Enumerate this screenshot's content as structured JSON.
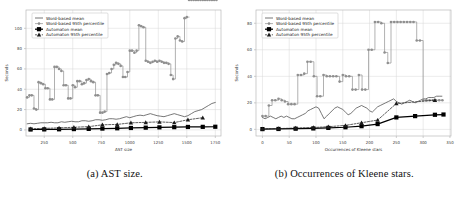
{
  "figure": {
    "subfigures": [
      {
        "caption": "(a) AST size.",
        "caption_label": "(a)",
        "caption_text": "AST size."
      },
      {
        "caption": "(b) Occurrences of Kleene stars.",
        "caption_label": "(b)",
        "caption_text": "Occurrences of Kleene stars."
      }
    ]
  },
  "legend_labels": {
    "word_mean": "Word-based mean",
    "word_p95": "Word-based 95th percentile",
    "auto_mean": "Automaton mean",
    "auto_p95": "Automaton 95th percentile"
  },
  "colors": {
    "word_mean": "#4a4a4a",
    "word_p95": "#8f8f8f",
    "auto_mean": "#000000",
    "auto_p95": "#1a1a1a",
    "grid": "#d6d6d6",
    "axis": "#b9b9b9",
    "background": "#ffffff"
  },
  "chart_data": [
    {
      "type": "line",
      "id": "ast-size",
      "title": "",
      "xlabel": "AST size",
      "ylabel": "Seconds",
      "xlim": [
        90,
        1800
      ],
      "ylim": [
        -6,
        118
      ],
      "xticks": [
        250,
        500,
        750,
        1000,
        1250,
        1500,
        1750
      ],
      "yticks": [
        0,
        20,
        40,
        60,
        80,
        100
      ],
      "grid": true,
      "legend_position": "upper left",
      "series": [
        {
          "name": "Word-based mean",
          "marker": "none",
          "x": [
            100,
            130,
            160,
            190,
            220,
            250,
            280,
            310,
            340,
            370,
            400,
            430,
            460,
            490,
            520,
            550,
            580,
            610,
            640,
            670,
            700,
            730,
            760,
            790,
            820,
            850,
            880,
            910,
            940,
            970,
            1000,
            1030,
            1060,
            1090,
            1120,
            1150,
            1180,
            1210,
            1240,
            1270,
            1300,
            1330,
            1360,
            1390,
            1420,
            1450,
            1480,
            1510,
            1540,
            1570,
            1600,
            1630,
            1660,
            1690,
            1720,
            1750
          ],
          "y": [
            6,
            6.5,
            6,
            6.5,
            7,
            7,
            7,
            7.5,
            7,
            7,
            8,
            7.5,
            8,
            8.5,
            8,
            8,
            9,
            9,
            8.5,
            9,
            10,
            10,
            9.5,
            10,
            11,
            11,
            10.5,
            11,
            12,
            13,
            12,
            13,
            14,
            14.5,
            14,
            15,
            16,
            15,
            14,
            13.5,
            13,
            14,
            15,
            16,
            15,
            14,
            13,
            14,
            16,
            18,
            19,
            20,
            22,
            24,
            26,
            27
          ]
        },
        {
          "name": "Word-based 95th percentile",
          "marker": "point",
          "x": [
            100,
            120,
            140,
            160,
            180,
            200,
            220,
            240,
            260,
            280,
            300,
            320,
            340,
            360,
            380,
            400,
            420,
            440,
            460,
            480,
            500,
            520,
            540,
            560,
            580,
            600,
            620,
            640,
            660,
            680,
            700,
            720,
            740,
            760,
            780,
            800,
            820,
            840,
            860,
            880,
            900,
            920,
            940,
            960,
            980,
            1000,
            1020,
            1040,
            1060,
            1080,
            1100,
            1120,
            1140,
            1160,
            1180,
            1200,
            1220,
            1240,
            1260,
            1280,
            1300,
            1320,
            1340,
            1360,
            1380,
            1400,
            1420,
            1440,
            1460,
            1480,
            1500,
            1520,
            1540,
            1560,
            1580,
            1600,
            1620,
            1640,
            1660,
            1680,
            1700,
            1720,
            1740,
            1760
          ],
          "y": [
            32,
            34,
            34,
            21,
            20,
            47,
            46,
            45,
            41,
            41,
            30,
            30,
            62,
            62,
            60,
            58,
            44,
            44,
            31,
            31,
            44,
            42,
            48,
            48,
            45,
            46,
            49,
            50,
            48,
            47,
            34,
            34,
            17,
            17,
            18,
            55,
            56,
            60,
            64,
            66,
            65,
            63,
            52,
            52,
            57,
            78,
            78,
            76,
            78,
            103,
            102,
            101,
            68,
            67,
            66,
            67,
            68,
            67,
            68,
            67,
            66,
            66,
            65,
            54,
            50,
            90,
            92,
            88,
            87,
            110,
            111
          ]
        },
        {
          "name": "Automaton mean",
          "marker": "square",
          "x": [
            130,
            250,
            380,
            510,
            640,
            760,
            890,
            1010,
            1140,
            1260,
            1390,
            1510,
            1640,
            1750
          ],
          "y": [
            0.4,
            0.5,
            0.6,
            0.8,
            1.0,
            1.3,
            1.6,
            1.9,
            2.2,
            2.5,
            2.7,
            2.9,
            3.0,
            3.1
          ]
        },
        {
          "name": "Automaton 95th percentile",
          "marker": "triangle",
          "x": [
            130,
            250,
            380,
            510,
            640,
            760,
            890,
            1010,
            1140,
            1260,
            1390,
            1510,
            1640
          ],
          "y": [
            1.2,
            1.5,
            2.0,
            2.6,
            3.2,
            5.0,
            5.4,
            7.0,
            7.4,
            7.9,
            7.2,
            10.0,
            12.0
          ]
        }
      ]
    },
    {
      "type": "line",
      "id": "kleene-stars",
      "title": "",
      "xlabel": "Occurrences of Kleene stars",
      "ylabel": "Seconds",
      "xlim": [
        -12,
        352
      ],
      "ylim": [
        -5,
        90
      ],
      "xticks": [
        0,
        50,
        100,
        150,
        200,
        250,
        300,
        350
      ],
      "yticks": [
        0,
        20,
        40,
        60,
        80
      ],
      "grid": true,
      "legend_position": "upper left",
      "series": [
        {
          "name": "Word-based mean",
          "marker": "none",
          "x": [
            0,
            5,
            10,
            15,
            20,
            25,
            30,
            35,
            40,
            45,
            50,
            55,
            60,
            65,
            70,
            75,
            80,
            85,
            90,
            95,
            100,
            105,
            110,
            115,
            120,
            125,
            130,
            135,
            140,
            145,
            150,
            155,
            160,
            165,
            170,
            175,
            180,
            185,
            190,
            195,
            200,
            205,
            210,
            215,
            220,
            225,
            230,
            235,
            240,
            245,
            250,
            255,
            260,
            265,
            270,
            275,
            280,
            285,
            290,
            295,
            300,
            305,
            310,
            315,
            320,
            325,
            330,
            335
          ],
          "y": [
            9,
            8,
            9,
            10,
            9,
            8,
            9,
            10,
            9,
            10,
            9,
            8,
            8,
            9,
            10,
            11,
            12,
            14,
            15,
            16,
            17,
            16,
            12,
            8,
            10,
            12,
            14,
            16,
            17,
            16,
            15,
            13,
            11,
            12,
            14,
            16,
            17,
            18,
            17,
            16,
            14,
            13,
            15,
            17,
            18,
            19,
            20,
            21,
            22,
            23,
            21,
            20,
            19,
            20,
            21,
            22,
            21,
            20,
            21,
            22,
            23,
            23,
            24,
            24,
            24,
            25,
            25,
            25
          ]
        },
        {
          "name": "Word-based 95th percentile",
          "marker": "point",
          "x": [
            0,
            6,
            12,
            18,
            24,
            30,
            36,
            42,
            48,
            54,
            60,
            66,
            72,
            78,
            84,
            90,
            96,
            102,
            108,
            114,
            120,
            126,
            132,
            138,
            144,
            150,
            156,
            162,
            168,
            174,
            180,
            186,
            192,
            198,
            204,
            210,
            216,
            222,
            228,
            234,
            240,
            246,
            252,
            258,
            264,
            270,
            276,
            282,
            288,
            294,
            300,
            306,
            312,
            318,
            324,
            330,
            336
          ],
          "y": [
            10,
            10,
            18,
            22,
            22,
            23,
            22,
            21,
            19,
            19,
            19,
            41,
            41,
            42,
            51,
            51,
            40,
            25,
            25,
            41,
            40,
            40,
            40,
            40,
            36,
            41,
            40,
            40,
            30,
            30,
            41,
            30,
            30,
            60,
            60,
            81,
            81,
            80,
            58,
            50,
            81,
            81,
            81,
            81,
            81,
            81,
            81,
            81,
            67,
            67,
            22,
            22,
            22,
            22,
            22,
            22,
            22
          ]
        },
        {
          "name": "Automaton mean",
          "marker": "square",
          "x": [
            0,
            30,
            62,
            95,
            123,
            155,
            185,
            215,
            250,
            285,
            322,
            338
          ],
          "y": [
            0.2,
            0.3,
            0.5,
            0.7,
            1.1,
            1.6,
            2.4,
            4.0,
            9.0,
            10.0,
            11.0,
            11.2
          ]
        },
        {
          "name": "Automaton 95th percentile",
          "marker": "triangle",
          "x": [
            0,
            30,
            62,
            95,
            123,
            155,
            185,
            215,
            250,
            322
          ],
          "y": [
            0.4,
            0.6,
            1.0,
            1.4,
            2.0,
            3.0,
            5.0,
            7.0,
            19.5,
            22.0
          ]
        }
      ]
    }
  ]
}
